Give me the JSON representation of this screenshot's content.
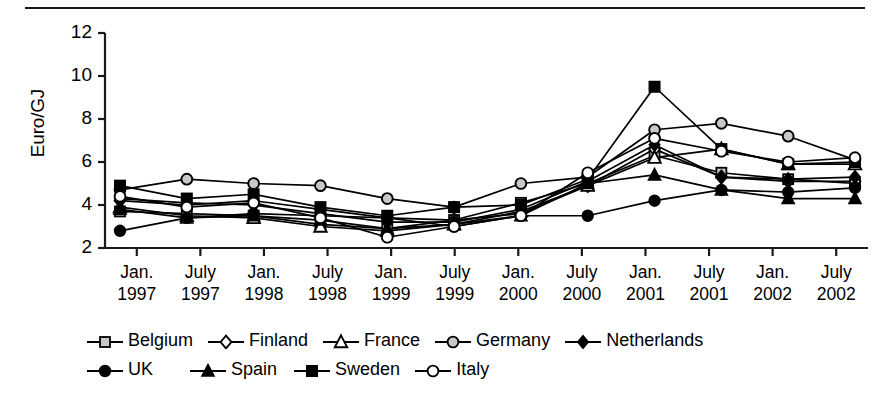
{
  "chart_data": {
    "type": "line",
    "title": "",
    "subtitle": "",
    "xlabel": "",
    "ylabel": "Euro/GJ",
    "ylim": [
      2,
      12
    ],
    "yticks": [
      2,
      4,
      6,
      8,
      10,
      12
    ],
    "grid": false,
    "legend_position": "bottom",
    "categories": [
      "Jan. 1997",
      "July 1997",
      "Jan. 1998",
      "July 1998",
      "Jan. 1999",
      "July 1999",
      "Jan. 2000",
      "July 2000",
      "Jan. 2001",
      "July 2001",
      "Jan. 2002",
      "July 2002"
    ],
    "xtick_labels": [
      {
        "line1": "Jan.",
        "line2": "1997"
      },
      {
        "line1": "July",
        "line2": "1997"
      },
      {
        "line1": "Jan.",
        "line2": "1998"
      },
      {
        "line1": "July",
        "line2": "1998"
      },
      {
        "line1": "Jan.",
        "line2": "1999"
      },
      {
        "line1": "July",
        "line2": "1999"
      },
      {
        "line1": "Jan.",
        "line2": "2000"
      },
      {
        "line1": "July",
        "line2": "2000"
      },
      {
        "line1": "Jan.",
        "line2": "2001"
      },
      {
        "line1": "July",
        "line2": "2001"
      },
      {
        "line1": "Jan.",
        "line2": "2002"
      },
      {
        "line1": "July",
        "line2": "2002"
      }
    ],
    "series": [
      {
        "name": "Belgium",
        "marker": "square-open-gray",
        "values": [
          3.7,
          3.6,
          3.5,
          3.1,
          2.9,
          3.3,
          4.1,
          5.0,
          6.3,
          5.5,
          5.2,
          5.0
        ]
      },
      {
        "name": "Finland",
        "marker": "diamond-open",
        "values": [
          4.2,
          4.0,
          4.2,
          3.8,
          3.4,
          3.3,
          3.6,
          4.9,
          6.6,
          5.3,
          5.1,
          5.1
        ]
      },
      {
        "name": "France",
        "marker": "triangle-open",
        "values": [
          3.9,
          3.5,
          3.4,
          3.0,
          2.8,
          3.1,
          3.7,
          4.9,
          6.2,
          6.6,
          5.9,
          5.9
        ]
      },
      {
        "name": "Germany",
        "marker": "circle-open-gray",
        "values": [
          4.7,
          5.2,
          5.0,
          4.9,
          4.3,
          3.9,
          5.0,
          5.3,
          7.5,
          7.8,
          7.2,
          6.1
        ]
      },
      {
        "name": "Netherlands",
        "marker": "diamond-filled",
        "values": [
          4.3,
          4.1,
          4.0,
          3.6,
          3.2,
          3.2,
          3.8,
          5.1,
          6.8,
          5.3,
          5.2,
          5.3
        ]
      },
      {
        "name": "UK",
        "marker": "circle-filled",
        "values": [
          2.8,
          3.4,
          3.6,
          3.5,
          3.4,
          3.0,
          3.5,
          3.5,
          4.2,
          4.7,
          4.6,
          4.8
        ]
      },
      {
        "name": "Spain",
        "marker": "triangle-filled",
        "values": [
          3.8,
          3.4,
          3.5,
          3.3,
          2.9,
          3.1,
          3.5,
          5.0,
          5.4,
          4.7,
          4.3,
          4.3
        ]
      },
      {
        "name": "Sweden",
        "marker": "square-filled",
        "values": [
          4.9,
          4.3,
          4.5,
          3.9,
          3.5,
          3.9,
          4.0,
          5.2,
          9.5,
          6.6,
          5.9,
          6.0
        ]
      },
      {
        "name": "Italy",
        "marker": "circle-open-white",
        "values": [
          4.4,
          3.9,
          4.1,
          3.4,
          2.5,
          3.0,
          3.5,
          5.5,
          7.1,
          6.5,
          6.0,
          6.2
        ]
      }
    ]
  },
  "axis": {
    "y_title": "Euro/GJ",
    "y_tick_labels": [
      "12",
      "10",
      "8",
      "6",
      "4",
      "2"
    ]
  },
  "legend": {
    "rows": [
      [
        "Belgium",
        "Finland",
        "France",
        "Germany",
        "Netherlands"
      ],
      [
        "UK",
        "Spain",
        "Sweden",
        "Italy"
      ]
    ]
  },
  "colors": {
    "line": "#000000",
    "axis": "#1a1a1a",
    "marker_gray_fill": "#c8c8c8",
    "marker_white_fill": "#ffffff",
    "marker_black_fill": "#000000",
    "background": "#ffffff"
  }
}
